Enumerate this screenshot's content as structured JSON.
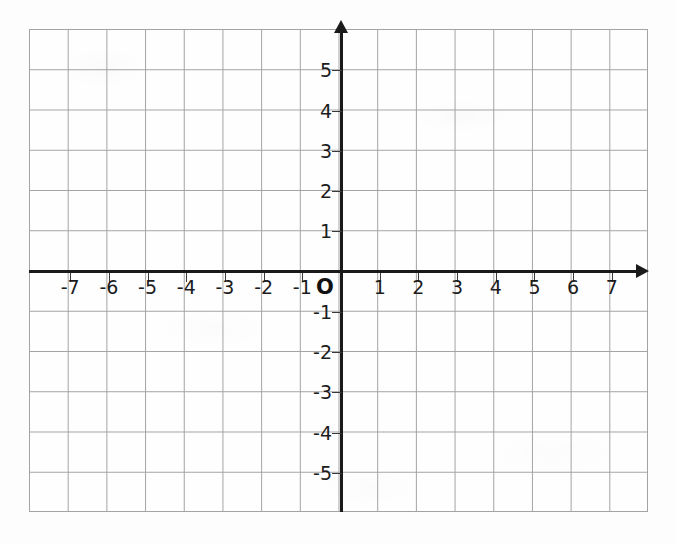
{
  "chart_data": {
    "type": "scatter",
    "title": "",
    "subtitle": "",
    "xlabel": "",
    "ylabel": "",
    "xlim": [
      -8,
      8
    ],
    "ylim": [
      -6,
      6
    ],
    "grid": true,
    "grid_step": 1,
    "legend": "none",
    "series": [],
    "annotations": [
      {
        "label": "O",
        "x": 0,
        "y": 0,
        "note": "origin marker"
      }
    ],
    "x_ticks": [
      -7,
      -6,
      -5,
      -4,
      -3,
      -2,
      -1,
      1,
      2,
      3,
      4,
      5,
      6,
      7
    ],
    "y_ticks": [
      5,
      4,
      3,
      2,
      1,
      -1,
      -2,
      -3,
      -4,
      -5
    ],
    "x_tick_labels": [
      "-7",
      "-6",
      "-5",
      "-4",
      "-3",
      "-2",
      "-1",
      "1",
      "2",
      "3",
      "4",
      "5",
      "6",
      "7"
    ],
    "y_tick_labels": [
      "5",
      "4",
      "3",
      "2",
      "1",
      "-1",
      "-2",
      "-3",
      "-4",
      "-5"
    ]
  },
  "axes": {
    "origin_label": "O",
    "x_labels": [
      {
        "text": "-7",
        "value": -7
      },
      {
        "text": "-6",
        "value": -6
      },
      {
        "text": "-5",
        "value": -5
      },
      {
        "text": "-4",
        "value": -4
      },
      {
        "text": "-3",
        "value": -3
      },
      {
        "text": "-2",
        "value": -2
      },
      {
        "text": "-1",
        "value": -1
      },
      {
        "text": "1",
        "value": 1
      },
      {
        "text": "2",
        "value": 2
      },
      {
        "text": "3",
        "value": 3
      },
      {
        "text": "4",
        "value": 4
      },
      {
        "text": "5",
        "value": 5
      },
      {
        "text": "6",
        "value": 6
      },
      {
        "text": "7",
        "value": 7
      }
    ],
    "y_labels": [
      {
        "text": "5",
        "value": 5
      },
      {
        "text": "4",
        "value": 4
      },
      {
        "text": "3",
        "value": 3
      },
      {
        "text": "2",
        "value": 2
      },
      {
        "text": "1",
        "value": 1
      },
      {
        "text": "-1",
        "value": -1
      },
      {
        "text": "-2",
        "value": -2
      },
      {
        "text": "-3",
        "value": -3
      },
      {
        "text": "-4",
        "value": -4
      },
      {
        "text": "-5",
        "value": -5
      }
    ]
  },
  "colors": {
    "axis": "#1a1a1a",
    "grid": "#a3a3a3",
    "label": "#1c1c1c",
    "paper": "#fdfdfd"
  },
  "geometry": {
    "grid_left": 29,
    "grid_top": 29,
    "grid_width": 619,
    "grid_height": 483,
    "cell_w": 38.6875,
    "cell_h": 40.25,
    "origin_x": 341,
    "origin_y": 271.5
  }
}
